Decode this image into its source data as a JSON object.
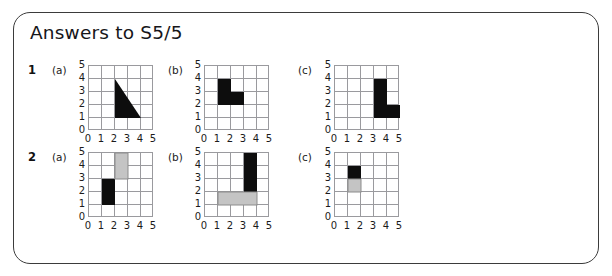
{
  "title": "Answers to S5/5",
  "axis": {
    "y_ticks": [
      "5",
      "4",
      "3",
      "2",
      "1",
      "0"
    ],
    "x_ticks": [
      "0",
      "1",
      "2",
      "3",
      "4",
      "5"
    ],
    "grid_min": 0,
    "grid_max": 5
  },
  "colors": {
    "black": "#0d0d0d",
    "gray": "#c4c4c4",
    "gray_stroke": "#8c8c8c",
    "gridline": "#9a9a9e",
    "frame": "#3b3b3b",
    "text": "#16161a"
  },
  "questions": [
    {
      "number": "1",
      "parts": [
        {
          "label": "(a)",
          "shapes": [
            {
              "kind": "polygon",
              "fill": "black",
              "points": [
                [
                  2,
                  4
                ],
                [
                  2,
                  1
                ],
                [
                  4,
                  1
                ]
              ]
            }
          ]
        },
        {
          "label": "(b)",
          "shapes": [
            {
              "kind": "rect",
              "fill": "black",
              "x": 1,
              "y": 2,
              "w": 1,
              "h": 2
            },
            {
              "kind": "rect",
              "fill": "black",
              "x": 2,
              "y": 2,
              "w": 1,
              "h": 1
            }
          ]
        },
        {
          "label": "(c)",
          "shapes": [
            {
              "kind": "rect",
              "fill": "black",
              "x": 3,
              "y": 1,
              "w": 1,
              "h": 3
            },
            {
              "kind": "rect",
              "fill": "black",
              "x": 4,
              "y": 1,
              "w": 1,
              "h": 1
            }
          ]
        }
      ]
    },
    {
      "number": "2",
      "parts": [
        {
          "label": "(a)",
          "shapes": [
            {
              "kind": "rect",
              "fill": "black",
              "x": 1,
              "y": 1,
              "w": 1,
              "h": 2
            },
            {
              "kind": "rect",
              "fill": "gray",
              "x": 2,
              "y": 3,
              "w": 1,
              "h": 2
            }
          ]
        },
        {
          "label": "(b)",
          "shapes": [
            {
              "kind": "rect",
              "fill": "black",
              "x": 3,
              "y": 2,
              "w": 1,
              "h": 3
            },
            {
              "kind": "rect",
              "fill": "gray",
              "x": 1,
              "y": 1,
              "w": 3,
              "h": 1
            }
          ]
        },
        {
          "label": "(c)",
          "shapes": [
            {
              "kind": "rect",
              "fill": "black",
              "x": 1,
              "y": 3,
              "w": 1,
              "h": 1
            },
            {
              "kind": "rect",
              "fill": "gray",
              "x": 1,
              "y": 2,
              "w": 1,
              "h": 1
            }
          ]
        }
      ]
    }
  ]
}
